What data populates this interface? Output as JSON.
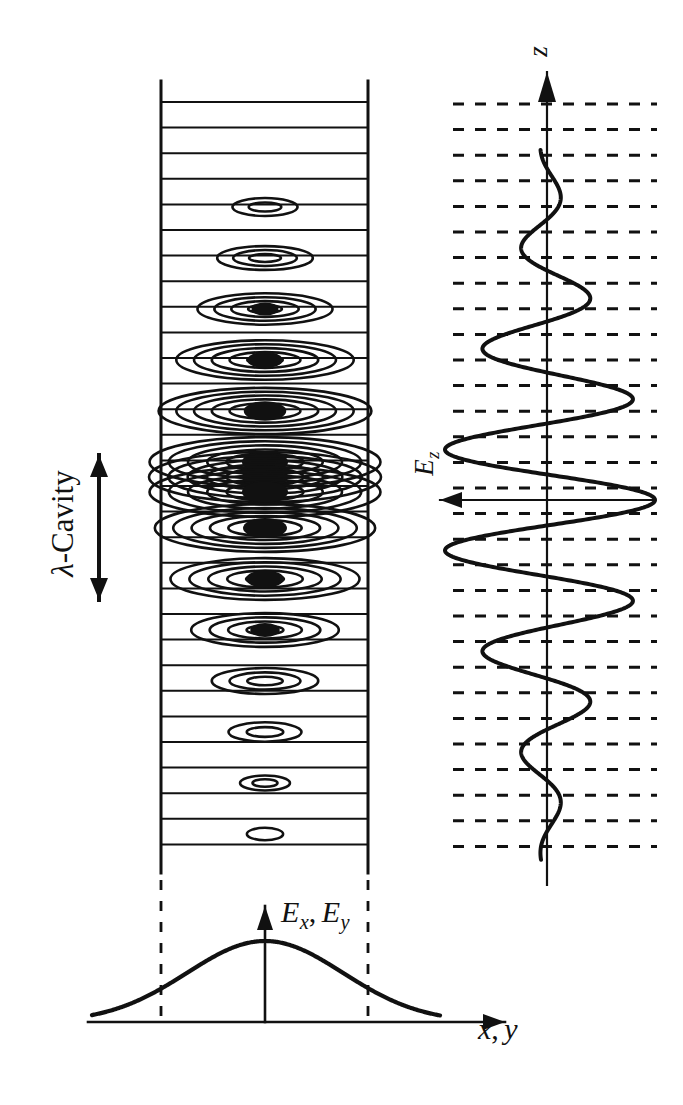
{
  "figure": {
    "kind": "optical-cavity-mode-diagram",
    "background_color": "#ffffff",
    "ink_color": "#111111",
    "width": 683,
    "height": 1105
  },
  "labels": {
    "cavity": {
      "lambda": "λ",
      "rest": "-Cavity"
    },
    "z_axis": "z",
    "ez": {
      "base": "E",
      "sub": "z"
    },
    "exy": {
      "base1": "E",
      "sub1": "x",
      "comma": ",",
      "base2": "E",
      "sub2": "y"
    },
    "xy": {
      "base1": "x",
      "comma": ",",
      "base2": "y"
    }
  },
  "cavity_panel": {
    "name": "cavity-contour-panel",
    "rect": {
      "x": 161,
      "y": 81,
      "width": 207,
      "height": 792
    },
    "wall_stroke": 3.0,
    "node_line_stroke": 2.0,
    "node_line_count": 30,
    "node_line_first_y": 102,
    "node_line_spacing": 25.6,
    "contour_center_x": 265,
    "envelope_center_y": 477,
    "envelope_sigma": 150,
    "lobe_centers_y": [
      207,
      258,
      309,
      360,
      411,
      462,
      477,
      492,
      528,
      579,
      630,
      681,
      732,
      783,
      834
    ],
    "contour_stroke": 2.6
  },
  "ez_panel": {
    "name": "ez-standing-wave-panel",
    "axis_x": 547,
    "axis_top_y": 72,
    "axis_bottom_y": 885,
    "axis_stroke": 2.2,
    "arrow_up": {
      "tip_y": 72,
      "half_width": 9,
      "length": 30
    },
    "ez_arrow": {
      "y": 500,
      "left_x": 440,
      "right_x": 655,
      "head_half_width": 8,
      "head_length": 22
    },
    "dashed_lines": {
      "x_start": 453,
      "x_end": 657,
      "first_y": 104,
      "spacing": 25.6,
      "count": 30,
      "dash": "11 11",
      "stroke": 3.0
    },
    "wave": {
      "stroke": 4.0,
      "center_y": 500,
      "half_period": 51,
      "sigma": 150,
      "max_amplitude": 108,
      "top_y": 150,
      "bottom_y": 860
    }
  },
  "transverse_panel": {
    "name": "transverse-gaussian-panel",
    "baseline": {
      "y": 1022,
      "x_start": 88,
      "x_end": 505,
      "stroke": 2.6
    },
    "x_arrow": {
      "tip_x": 505,
      "head_half_width": 8,
      "head_length": 22
    },
    "v_axis": {
      "x": 265,
      "top_y": 906,
      "bottom_y": 1022,
      "stroke": 2.6
    },
    "v_arrow": {
      "tip_y": 906,
      "half_width": 8,
      "length": 24
    },
    "gauss": {
      "peak_x": 265,
      "peak_y": 941,
      "sigma": 78,
      "x_start": 92,
      "x_end": 440,
      "stroke": 4.2
    },
    "dashed_verticals": {
      "xs": [
        161,
        368
      ],
      "top_y": 880,
      "bottom_y": 1022,
      "dash": "10 11",
      "stroke": 2.8
    }
  },
  "cavity_arrow": {
    "name": "cavity-extent-arrow",
    "x": 99,
    "top_y": 455,
    "bottom_y": 600,
    "stroke": 4.0,
    "head_half_width": 9,
    "head_length": 22
  }
}
